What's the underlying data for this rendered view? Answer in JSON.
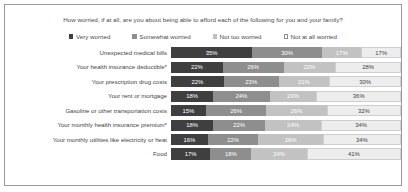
{
  "chart": {
    "title": "How worried, if at all, are you about being able to afford each of the following for you and your family?",
    "legend": [
      {
        "label": "Very worried",
        "color": "#3f3f3f",
        "swatch": "filled-square-icon"
      },
      {
        "label": "Somewhat worried",
        "color": "#8e8e8e",
        "swatch": "filled-square-icon"
      },
      {
        "label": "Not too worried",
        "color": "#c2c2c2",
        "swatch": "filled-square-icon"
      },
      {
        "label": "Not at all worried",
        "color": "#ededed",
        "swatch": "outlined-square-icon"
      }
    ]
  },
  "chart_data": {
    "type": "bar",
    "orientation": "horizontal",
    "stacked": true,
    "normalized": true,
    "title": "How worried, if at all, are you about being able to afford each of the following for you and your family?",
    "xlabel": "",
    "ylabel": "",
    "xlim": [
      0,
      100
    ],
    "grid": false,
    "legend_position": "top-center",
    "categories": [
      "Unexpected medical bills",
      "Your health insurance deductible*",
      "Your prescription drug costs",
      "Your rent or mortgage",
      "Gasoline or other transportation costs",
      "Your monthly health insurance premium*",
      "Your monthly utilities like electricity or heat",
      "Food"
    ],
    "series": [
      {
        "name": "Very worried",
        "color": "#3f3f3f",
        "values": [
          35,
          22,
          22,
          18,
          15,
          18,
          16,
          17
        ]
      },
      {
        "name": "Somewhat worried",
        "color": "#8e8e8e",
        "values": [
          30,
          26,
          23,
          24,
          26,
          22,
          22,
          18
        ]
      },
      {
        "name": "Not too worried",
        "color": "#c2c2c2",
        "values": [
          17,
          22,
          21,
          20,
          26,
          24,
          28,
          24
        ]
      },
      {
        "name": "Not at all worried",
        "color": "#ededed",
        "values": [
          17,
          28,
          30,
          36,
          32,
          34,
          34,
          41
        ]
      }
    ],
    "rows": [
      {
        "label": "Unexpected medical bills",
        "values": [
          35,
          30,
          17,
          17
        ],
        "labels": [
          "35%",
          "30%",
          "17%",
          "17%"
        ]
      },
      {
        "label": "Your health insurance deductible*",
        "values": [
          22,
          26,
          22,
          28
        ],
        "labels": [
          "22%",
          "26%",
          "22%",
          "28%"
        ]
      },
      {
        "label": "Your prescription drug costs",
        "values": [
          22,
          23,
          21,
          30
        ],
        "labels": [
          "22%",
          "23%",
          "21%",
          "30%"
        ]
      },
      {
        "label": "Your rent or mortgage",
        "values": [
          18,
          24,
          20,
          36
        ],
        "labels": [
          "18%",
          "24%",
          "20%",
          "36%"
        ]
      },
      {
        "label": "Gasoline or other transportation costs",
        "values": [
          15,
          26,
          26,
          32
        ],
        "labels": [
          "15%",
          "26%",
          "26%",
          "32%"
        ]
      },
      {
        "label": "Your monthly health insurance premium*",
        "values": [
          18,
          22,
          24,
          34
        ],
        "labels": [
          "18%",
          "22%",
          "24%",
          "34%"
        ]
      },
      {
        "label": "Your monthly utilities like electricity or heat",
        "values": [
          16,
          22,
          28,
          34
        ],
        "labels": [
          "16%",
          "22%",
          "28%",
          "34%"
        ]
      },
      {
        "label": "Food",
        "values": [
          17,
          18,
          24,
          41
        ],
        "labels": [
          "17%",
          "18%",
          "24%",
          "41%"
        ]
      }
    ]
  }
}
